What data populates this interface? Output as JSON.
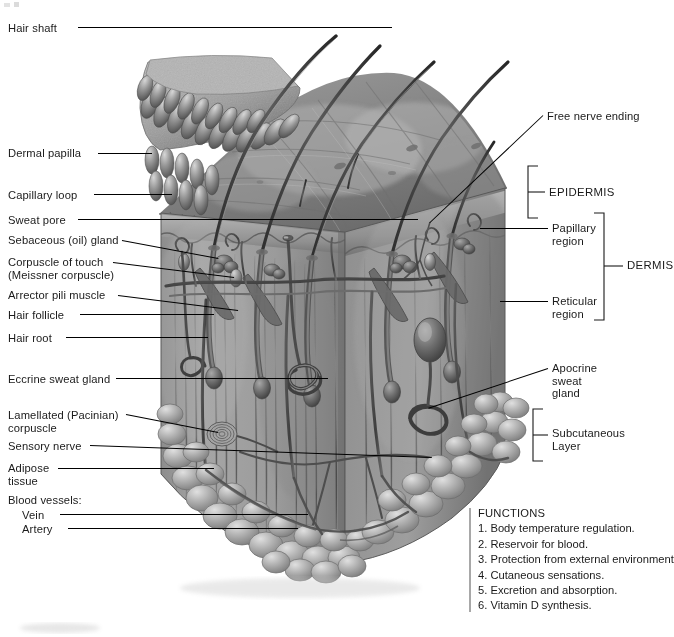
{
  "figure": {
    "type": "anatomical-illustration",
    "view": "three-dimensional sectional block of skin and subcutaneous layer",
    "style": "grayscale medical illustration"
  },
  "labels_left": [
    {
      "id": "hair-shaft",
      "text": "Hair shaft",
      "text2": "",
      "x": 8,
      "y": 22,
      "line_x1": 78,
      "line_y1": 27,
      "line_x2": 392,
      "line_y2": 27
    },
    {
      "id": "dermal-papilla",
      "text": "Dermal papilla",
      "text2": "",
      "x": 8,
      "y": 147,
      "line_x1": 98,
      "line_y1": 153,
      "line_x2": 152,
      "line_y2": 153
    },
    {
      "id": "capillary-loop",
      "text": "Capillary loop",
      "text2": "",
      "x": 8,
      "y": 189,
      "line_x1": 94,
      "line_y1": 194,
      "line_x2": 172,
      "line_y2": 194
    },
    {
      "id": "sweat-pore",
      "text": "Sweat pore",
      "text2": "",
      "x": 8,
      "y": 214,
      "line_x1": 78,
      "line_y1": 219,
      "line_x2": 418,
      "line_y2": 219
    },
    {
      "id": "sebaceous-gland",
      "text": "Sebaceous (oil) gland",
      "text2": "",
      "x": 8,
      "y": 234,
      "line_x1": 122,
      "line_y1": 240,
      "line_x2": 218,
      "line_y2": 258
    },
    {
      "id": "corpuscle-touch",
      "text": "Corpuscle of touch",
      "text2": "(Meissner corpuscle)",
      "x": 8,
      "y": 256,
      "line_x1": 113,
      "line_y1": 262,
      "line_x2": 234,
      "line_y2": 277
    },
    {
      "id": "arrector-pili",
      "text": "Arrector pili muscle",
      "text2": "",
      "x": 8,
      "y": 289,
      "line_x1": 118,
      "line_y1": 295,
      "line_x2": 238,
      "line_y2": 310
    },
    {
      "id": "hair-follicle",
      "text": "Hair follicle",
      "text2": "",
      "x": 8,
      "y": 309,
      "line_x1": 80,
      "line_y1": 314,
      "line_x2": 214,
      "line_y2": 314
    },
    {
      "id": "hair-root",
      "text": "Hair root",
      "text2": "",
      "x": 8,
      "y": 332,
      "line_x1": 66,
      "line_y1": 337,
      "line_x2": 208,
      "line_y2": 337
    },
    {
      "id": "eccrine-gland",
      "text": "Eccrine sweat gland",
      "text2": "",
      "x": 8,
      "y": 373,
      "line_x1": 116,
      "line_y1": 378,
      "line_x2": 328,
      "line_y2": 378
    },
    {
      "id": "pacinian",
      "text": "Lamellated (Pacinian)",
      "text2": "corpuscle",
      "x": 8,
      "y": 409,
      "line_x1": 126,
      "line_y1": 414,
      "line_x2": 218,
      "line_y2": 432
    },
    {
      "id": "sensory-nerve",
      "text": "Sensory nerve",
      "text2": "",
      "x": 8,
      "y": 440,
      "line_x1": 90,
      "line_y1": 445,
      "line_x2": 432,
      "line_y2": 457
    },
    {
      "id": "adipose-tissue",
      "text": "Adipose",
      "text2": "tissue",
      "x": 8,
      "y": 462,
      "line_x1": 58,
      "line_y1": 468,
      "line_x2": 214,
      "line_y2": 468
    },
    {
      "id": "blood-vessels",
      "text": "Blood vessels:",
      "text2": "",
      "x": 8,
      "y": 494,
      "line_x1": 0,
      "line_y1": 0,
      "line_x2": 0,
      "line_y2": 0
    },
    {
      "id": "vein",
      "text": "Vein",
      "text2": "",
      "x": 22,
      "y": 509,
      "line_x1": 60,
      "line_y1": 514,
      "line_x2": 308,
      "line_y2": 514
    },
    {
      "id": "artery",
      "text": "Artery",
      "text2": "",
      "x": 22,
      "y": 523,
      "line_x1": 68,
      "line_y1": 528,
      "line_x2": 298,
      "line_y2": 528
    }
  ],
  "labels_right": [
    {
      "id": "free-nerve-ending",
      "text": "Free nerve ending",
      "text2": "",
      "x": 547,
      "y": 110,
      "line_x1": 543,
      "line_y1": 115,
      "line_x2": 430,
      "line_y2": 222
    },
    {
      "id": "papillary-region",
      "text": "Papillary",
      "text2": "region",
      "x": 552,
      "y": 222,
      "line_x1": 548,
      "line_y1": 228,
      "line_x2": 480,
      "line_y2": 228
    },
    {
      "id": "reticular-region",
      "text": "Reticular",
      "text2": "region",
      "x": 552,
      "y": 295,
      "line_x1": 548,
      "line_y1": 301,
      "line_x2": 500,
      "line_y2": 301
    },
    {
      "id": "apocrine-gland",
      "text": "Apocrine",
      "text2": "sweat",
      "text3": "gland",
      "x": 552,
      "y": 362,
      "line_x1": 548,
      "line_y1": 368,
      "line_x2": 428,
      "line_y2": 408
    },
    {
      "id": "subcutaneous",
      "text": "Subcutaneous",
      "text2": "Layer",
      "x": 552,
      "y": 427,
      "line_x1": 0,
      "line_y1": 0,
      "line_x2": 0,
      "line_y2": 0
    }
  ],
  "region_labels": {
    "epidermis": "EPIDERMIS",
    "dermis": "DERMIS"
  },
  "brackets": [
    {
      "id": "epidermis-bracket",
      "x": 528,
      "y": 165,
      "height": 54,
      "tick_len": 10,
      "label": "EPIDERMIS",
      "label_x": 549,
      "label_y": 185
    },
    {
      "id": "dermis-bracket",
      "x": 604,
      "y": 212,
      "height": 108,
      "tick_len": 11,
      "label": "DERMIS",
      "label_x": 627,
      "label_y": 260
    },
    {
      "id": "subcutaneous-bracket",
      "x": 533,
      "y": 408,
      "height": 53,
      "tick_len": 11,
      "label": "Subcutaneous",
      "label_x": 552,
      "label_y": 427
    }
  ],
  "functions": {
    "heading": "FUNCTIONS",
    "items": [
      "1. Body temperature regulation.",
      "2. Reservoir for blood.",
      "3. Protection from external environment.",
      "4. Cutaneous sensations.",
      "5. Excretion and absorption.",
      "6. Vitamin D synthesis."
    ]
  },
  "colors": {
    "background": "#ffffff",
    "text": "#1a1a1a",
    "leader_line": "#000000",
    "functions_bar": "#a8a8a8",
    "skin_surface_light": "#b9b9b9",
    "skin_surface_mid": "#8e8e8e",
    "skin_surface_dark": "#6e6e6e",
    "epidermis_band": "#a5a5a5",
    "dermis_fill": "#9a9a9a",
    "dermis_shadow": "#6a6a6a",
    "adipose_fill": "#b2b2b2",
    "hair_dark": "#3b3b3b",
    "vessel_dark": "#4a4a4a"
  },
  "illustration_features": [
    "peeled-back epidermis flap with dermal papillae (upper left)",
    "five curving hair shafts emerging from skin surface",
    "sectional face of epidermis and dermis on front-left",
    "hair follicles with roots and arrector pili muscles",
    "coiled eccrine sweat glands in dermis",
    "apocrine sweat gland (right side, deep dermis)",
    "lamellated Pacinian corpuscle near subcutaneous border",
    "lobular adipose tissue forming subcutaneous layer",
    "network of blood vessels: arteries and veins"
  ]
}
